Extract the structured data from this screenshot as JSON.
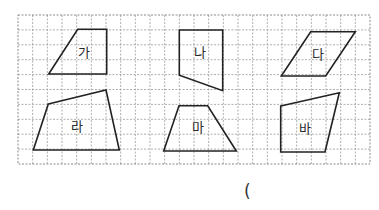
{
  "grid": {
    "x": 18,
    "y": 15,
    "width": 352,
    "height": 149,
    "columns": 24,
    "rows": 10
  },
  "shapes": [
    {
      "label": "가",
      "points": [
        [
          77.7,
          29.3
        ],
        [
          106.7,
          29.3
        ],
        [
          106.7,
          74
        ],
        [
          48.7,
          74
        ]
      ],
      "label_pos": [
        84,
        53
      ]
    },
    {
      "label": "나",
      "points": [
        [
          179.3,
          30
        ],
        [
          222.7,
          30
        ],
        [
          222.7,
          90.7
        ],
        [
          179.3,
          75.3
        ]
      ],
      "label_pos": [
        200,
        53
      ]
    },
    {
      "label": "다",
      "points": [
        [
          310.7,
          31.7
        ],
        [
          355.3,
          31.7
        ],
        [
          325.7,
          76
        ],
        [
          281.3,
          76
        ]
      ],
      "label_pos": [
        318,
        55
      ]
    },
    {
      "label": "라",
      "points": [
        [
          48.3,
          104
        ],
        [
          106,
          90
        ],
        [
          119.3,
          150
        ],
        [
          33.3,
          150
        ]
      ],
      "label_pos": [
        77,
        127
      ]
    },
    {
      "label": "마",
      "points": [
        [
          179,
          105.7
        ],
        [
          207.7,
          105.7
        ],
        [
          236.3,
          151
        ],
        [
          163.7,
          151
        ]
      ],
      "label_pos": [
        198,
        128
      ]
    },
    {
      "label": "바",
      "points": [
        [
          280.7,
          106
        ],
        [
          339.3,
          92.7
        ],
        [
          325,
          152
        ],
        [
          280.7,
          152
        ]
      ],
      "label_pos": [
        305,
        129
      ]
    }
  ],
  "answer": {
    "open_paren": "("
  }
}
